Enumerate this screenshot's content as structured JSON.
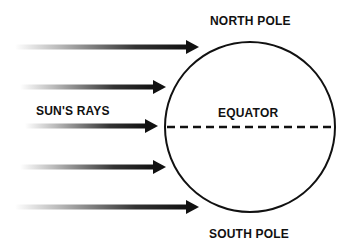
{
  "diagram": {
    "labels": {
      "north_pole": "NORTH POLE",
      "south_pole": "SOUTH POLE",
      "equator": "EQUATOR",
      "suns_rays": "SUN'S RAYS"
    },
    "earth": {
      "cx": 250,
      "cy": 127,
      "r": 85,
      "stroke": "#111111"
    },
    "equator_line": {
      "style": "dashed",
      "color": "#111111"
    },
    "rays": [
      {
        "y": 47,
        "x_start": 15,
        "x_tip": 199
      },
      {
        "y": 87,
        "x_start": 20,
        "x_tip": 166
      },
      {
        "y": 126,
        "x_start": 25,
        "x_tip": 158
      },
      {
        "y": 167,
        "x_start": 20,
        "x_tip": 166
      },
      {
        "y": 207,
        "x_start": 15,
        "x_tip": 199
      }
    ],
    "colors": {
      "ray_dark": "#111111",
      "ray_fade": "#ffffff",
      "background": "#ffffff"
    }
  }
}
